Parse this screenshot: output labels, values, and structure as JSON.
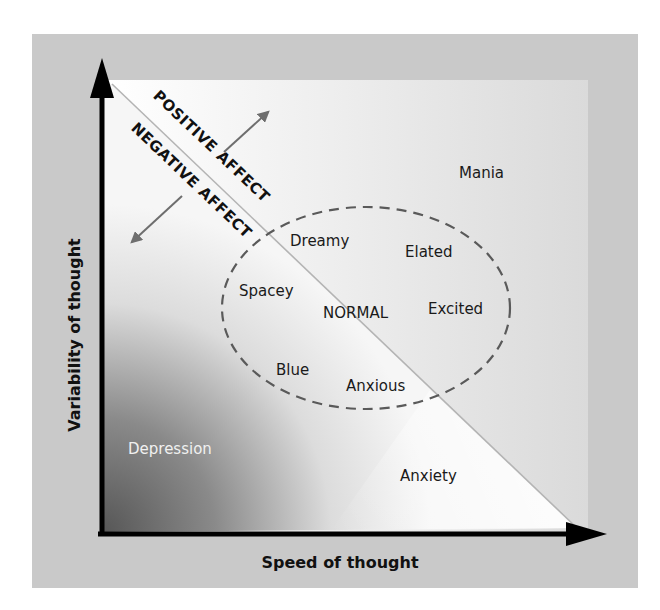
{
  "diagram": {
    "axes": {
      "x_label": "Speed of thought",
      "y_label": "Variability of thought"
    },
    "divider": {
      "upper_label": "POSITIVE AFFECT",
      "lower_label": "NEGATIVE AFFECT"
    },
    "normal_region": {
      "center_label": "NORMAL",
      "states": [
        "Dreamy",
        "Elated",
        "Spacey",
        "Excited",
        "Blue",
        "Anxious"
      ]
    },
    "extremes": {
      "top_right": "Mania",
      "bottom_left": "Depression",
      "bottom_right": "Anxiety"
    },
    "colors": {
      "frame": "#c8c8c8",
      "axis": "#000000",
      "arrow": "#6e6e6e",
      "dashed_ellipse": "#5a5a5a",
      "divider_line": "#b4b4b4",
      "depression_text": "#f0f0f0"
    }
  }
}
